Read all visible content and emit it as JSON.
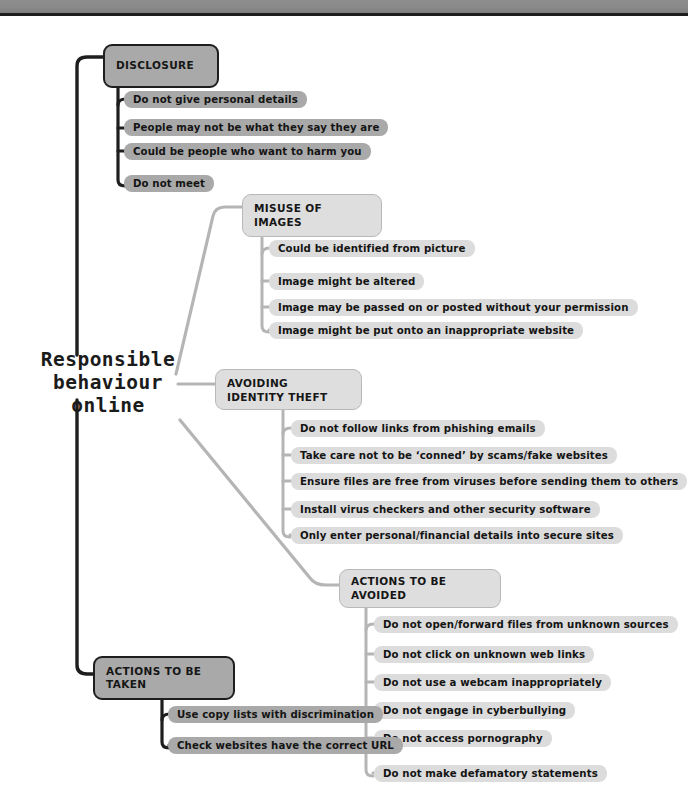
{
  "diagram": {
    "type": "mind-map",
    "root": {
      "label": "Responsible\nbehaviour\nonline"
    },
    "branches": [
      {
        "id": "disclosure",
        "title": "DISCLOSURE",
        "style": "dark",
        "leaves": [
          "Do not give personal details",
          "People may not be what they say they are",
          "Could be people who want to harm you",
          "Do not meet"
        ]
      },
      {
        "id": "misuse-of-images",
        "title": "MISUSE OF IMAGES",
        "style": "light",
        "leaves": [
          "Could be identified from picture",
          "Image might be altered",
          "Image may be passed on or posted without your permission",
          "Image might be put onto an inappropriate website"
        ]
      },
      {
        "id": "avoiding-identity-theft",
        "title": "AVOIDING IDENTITY THEFT",
        "style": "light",
        "leaves": [
          "Do not follow links from phishing emails",
          "Take care not to be ‘conned’ by scams/fake websites",
          "Ensure files are free from viruses before sending them to others",
          "Install virus checkers  and other security software",
          "Only enter personal/financial details into secure sites"
        ]
      },
      {
        "id": "actions-to-be-avoided",
        "title": "ACTIONS TO BE AVOIDED",
        "style": "light",
        "leaves": [
          "Do not open/forward files from unknown sources",
          "Do not click on unknown web links",
          "Do not use a webcam inappropriately",
          "Do not engage in cyberbullying",
          "Do not access pornography",
          "Do not make defamatory statements"
        ]
      },
      {
        "id": "actions-to-be-taken",
        "title": "ACTIONS TO BE TAKEN",
        "style": "dark",
        "leaves": [
          "Use copy lists with discrimination",
          "Check websites have the correct URL"
        ]
      }
    ],
    "colors": {
      "dark_fill": "#a9a9a9",
      "dark_stroke": "#1e1e1e",
      "light_fill": "#dedede",
      "light_leaf_fill": "#dcdcdc",
      "light_stroke": "#b9b9b9",
      "text": "#141414",
      "page_edge_bar": "#8a8a8a"
    }
  }
}
